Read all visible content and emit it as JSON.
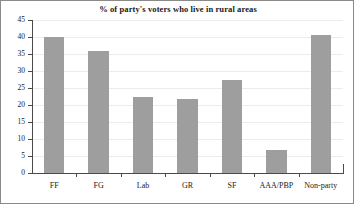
{
  "chart_data": {
    "type": "bar",
    "title": "% of party's voters who live in rural areas",
    "xlabel": "",
    "ylabel": "",
    "categories": [
      "FF",
      "FG",
      "Lab",
      "GR",
      "SF",
      "AAA/PBP",
      "Non-party"
    ],
    "values": [
      40.0,
      35.8,
      22.5,
      21.8,
      27.5,
      6.9,
      40.5
    ],
    "ylim": [
      0,
      45
    ],
    "yticks": [
      0,
      5,
      10,
      15,
      20,
      25,
      30,
      35,
      40,
      45
    ],
    "ytick_labels": [
      "0",
      "5",
      "10",
      "15",
      "20",
      "25",
      "30",
      "35",
      "40",
      "45"
    ],
    "grid": true,
    "legend": false,
    "bar_color": "#9e9e9e",
    "axis_color": "#4a4a4a",
    "grid_color": "#ececec",
    "background": "#ffffff",
    "border_color": "#8a8a8a"
  }
}
